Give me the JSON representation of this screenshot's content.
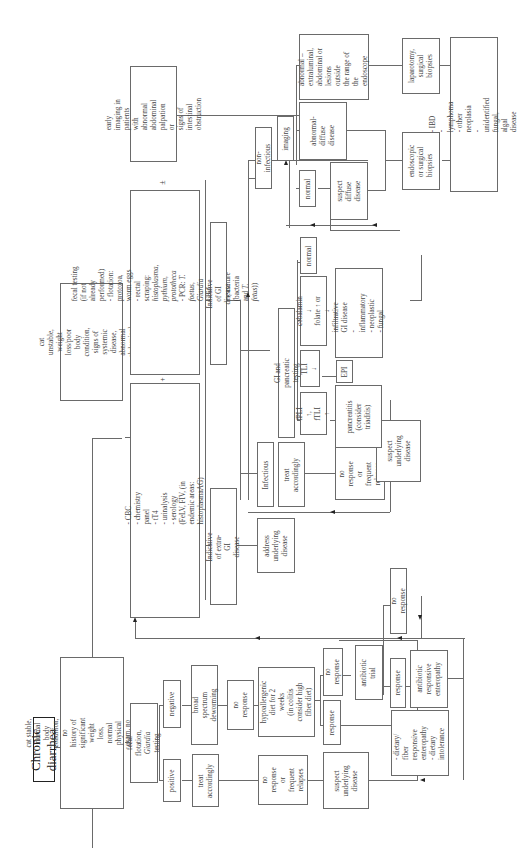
{
  "title": "Chronic diarrhea",
  "orientation": "rotated 90deg counter-clockwise",
  "branches": {
    "stable": {
      "condition": "cat stable, normal body condition, no\nhistory of significant weight loss,\nnormal physical exam, no signs of\nsystemic disease",
      "fecal_testing": "fecal flotation,\nGiardia testing",
      "positive": "positive",
      "negative": "negative",
      "treat_accordingly": "treat\naccordingly",
      "no_response_relapses": "no\nresponse\nor frequent\nrelapses",
      "suspect_underlying": "suspect\nunderlying\ndisease",
      "deworming": "broad spectrum\ndeworming",
      "no_response_1": "no\nresponse",
      "diet_trial": "hypoallergenic\ndiet for 2 weeks\n(in colitis\nconsider high\nfiber diet)",
      "response_diet": "response",
      "dietary_outcome": "- dietary/ fiber\n  responsive\n  enteropathy\n- dietary\n  intolerance",
      "no_response_2": "no\nresponse",
      "antibiotic_trial": "antibiotic\ntrial",
      "response_antibiotic": "response",
      "antibiotic_outcome": "antibiotic\nresponsive\nenteropathy",
      "no_response_3": "no response"
    },
    "unstable": {
      "condition": "cat unstable, weight loss/poor body\ncondition, signs of systemic disease,\nabnormal abdominal palpation",
      "labwork": "- CBC\n- chemistry panel\n- tT4\n- urinalysis\n- serology (FeLV, FIV, (in endemic areas: histoplasmaAG)",
      "plus": "+",
      "fecal_testing": "fecal testing (if not already performed)\n  - flotation: protozoa, worm eggs\n  - rectal scraping: histoplasma, pythium, prototheca\n  - PCR: T. foetus, Giardia\n  - IFA: Giardia\n  - (-culture (bacteria and T. fetus))",
      "plus_minus": "±",
      "early_imaging": "early imaging in\npatients with abnormal\nabdominal palpation or\nsigns of intestinal\nobstruction",
      "extra_gi": "Indicative of extra-GI\ndisease",
      "address_underlying": "address\nunderlying\ndisease",
      "gi_disease": "Indicative of GI disease",
      "infectious": "Infectious",
      "treat_accordingly": "treat\naccordingly",
      "no_response_relapses": "no\nresponse\nor frequent\nrelapses",
      "suspect_underlying": "suspect\nunderlying\ndisease",
      "gi_pancreatic": "GI and pancreatic testing",
      "fpli": "fPLI ↑,\nfTLI ↑",
      "pancreatitis": "pancreatitis\n(consider\ntriaditis)",
      "tli": "TLI ↓",
      "epi": "EPI",
      "cobalamin": "cobalamin ↓\nfolate ↑ or ↓",
      "infiltrative": "infiltrative GI disease\n - inflammatory\n - neoplastic\n - fungal",
      "normal_1": "normal",
      "non_infectious": "non-infectious",
      "imaging": "imaging",
      "normal_2": "normal",
      "suspect_diffuse": "suspect\ndiffuse\ndisease",
      "abnormal_diffuse": "abnormal-\ndiffuse\ndisease",
      "abnormal_extraluminal": "abnormal –\nextraluminal,\nabdominal or\nlesions outside\nthe range of\nthe endoscope",
      "endoscopic_biopsies": "endoscopic\nor surgical\nbiopsies",
      "laparotomy": "laparotomy,\nsurgical\nbiopsies",
      "final_dx": "- IBD\n- lymphoma\n- other neoplasia\n- unidentified fungal, algal disease"
    }
  }
}
